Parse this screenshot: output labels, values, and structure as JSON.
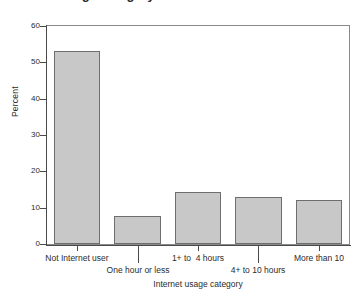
{
  "figure": {
    "title_remnant": "Internet usage category bar chart",
    "title_visible_note": "cropped"
  },
  "chart_data": {
    "type": "bar",
    "title": "",
    "xlabel": "Internet usage category",
    "ylabel": "Percent",
    "categories": [
      "Not Internet user",
      "One hour or less",
      "1+ to  4 hours",
      "4+ to 10 hours",
      "More than 10"
    ],
    "values": [
      53.0,
      7.6,
      14.2,
      13.0,
      12.0
    ],
    "ylim": [
      0,
      60
    ],
    "yticks": [
      0,
      10,
      20,
      30,
      40,
      50,
      60
    ],
    "ytick_labels": [
      "0",
      "10",
      "20",
      "30",
      "40",
      "50",
      "60"
    ],
    "grid": false,
    "legend": false,
    "legend_position": "none",
    "label_stagger": [
      "row1",
      "row2",
      "row1",
      "row2",
      "row1"
    ],
    "bar_fill": "#c8c8c8",
    "bar_edge": "#6e6e6e",
    "axis_color": "#4a4a4a",
    "frame_color": "#8a8a8a"
  }
}
